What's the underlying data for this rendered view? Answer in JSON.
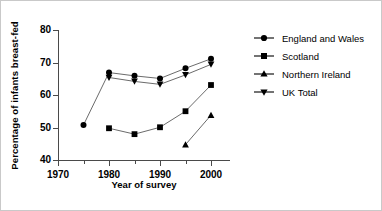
{
  "chart_data": {
    "type": "line",
    "title": "",
    "xlabel": "Year of survey",
    "ylabel": "Percentage of infants breast-fed",
    "xlim": [
      1970,
      2003
    ],
    "ylim": [
      40,
      80
    ],
    "xticks": [
      1970,
      1980,
      1990,
      2000
    ],
    "xticks_minor": [
      1975,
      1985,
      1995
    ],
    "yticks": [
      40,
      50,
      60,
      70,
      80
    ],
    "grid": false,
    "legend_position": "right",
    "series": [
      {
        "name": "England and Wales",
        "marker": "circle",
        "x": [
          1975,
          1980,
          1985,
          1990,
          1995,
          2000
        ],
        "values": [
          51.0,
          67.0,
          66.0,
          65.2,
          68.3,
          71.2
        ]
      },
      {
        "name": "Scotland",
        "marker": "square",
        "x": [
          1980,
          1985,
          1990,
          1995,
          2000
        ],
        "values": [
          50.0,
          48.2,
          50.3,
          55.2,
          63.2
        ]
      },
      {
        "name": "Northern Ireland",
        "marker": "triangle-up",
        "x": [
          1995,
          2000
        ],
        "values": [
          45.0,
          54.0
        ]
      },
      {
        "name": "UK Total",
        "marker": "triangle-down",
        "x": [
          1980,
          1985,
          1990,
          1995,
          2000
        ],
        "values": [
          65.5,
          64.3,
          63.4,
          66.3,
          69.5
        ]
      }
    ]
  },
  "axis": {
    "y_tick_labels": [
      "80",
      "70",
      "60",
      "50",
      "40"
    ],
    "x_tick_labels": [
      "1970",
      "1980",
      "1990",
      "2000"
    ],
    "x_title": "Year of survey",
    "y_title": "Percentage of infants breast-fed"
  },
  "legend": {
    "items": [
      {
        "label": "England and Wales",
        "marker": "circle-marker-icon"
      },
      {
        "label": "Scotland",
        "marker": "square-marker-icon"
      },
      {
        "label": "Northern Ireland",
        "marker": "triangle-up-marker-icon"
      },
      {
        "label": "UK Total",
        "marker": "triangle-down-marker-icon"
      }
    ]
  },
  "colors": {
    "line": "#6b6b6b",
    "marker": "#000000",
    "axis": "#4a4a4a",
    "background": "#ffffff",
    "border": "#c9c9c9"
  }
}
